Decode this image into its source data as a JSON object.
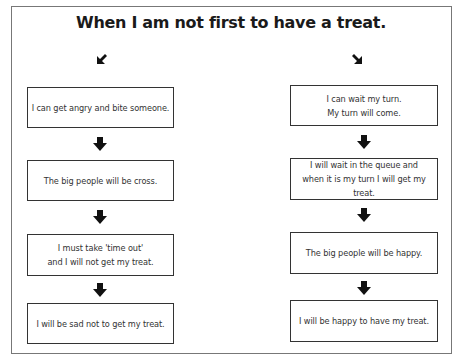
{
  "title": "When I am not first to have a treat.",
  "left_branch": {
    "start_arrow": "diagonal-down-left-arrow",
    "steps": [
      {
        "text": "I can get angry and bite someone."
      },
      {
        "text": "The big people will be cross."
      },
      {
        "text": "I must take 'time out'\nand I will not get my treat."
      },
      {
        "text": "I will be sad not to get my treat."
      }
    ]
  },
  "right_branch": {
    "start_arrow": "diagonal-down-right-arrow",
    "steps": [
      {
        "text": "I can wait my turn.\nMy turn will come."
      },
      {
        "text": "I will wait in the queue and\nwhen it is my turn I will get my treat."
      },
      {
        "text": "The big people will be happy."
      },
      {
        "text": "I will be happy to have my treat."
      }
    ]
  },
  "connector_icon": "down-arrow",
  "colors": {
    "border": "#333333",
    "arrow": "#111111",
    "text": "#333333"
  }
}
